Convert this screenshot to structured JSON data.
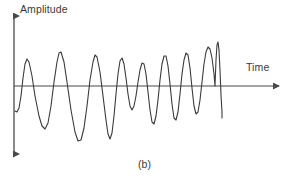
{
  "figure": {
    "caption": "(b)",
    "axes": {
      "y_label": "Amplitude",
      "x_label": "Time",
      "axis_color": "#4a4a4a",
      "y_axis_x": 14,
      "y_axis_top": 12,
      "y_axis_bottom": 158,
      "x_axis_y": 86,
      "x_axis_left": 14,
      "x_axis_right": 283
    },
    "curve": {
      "color": "#3a3a3a",
      "stroke_width": 1.1,
      "description": "amplitude-modulated oscillation with increasing frequency"
    }
  },
  "chart_data": {
    "type": "line",
    "title": "",
    "subtitle": "(b)",
    "xlabel": "Time",
    "ylabel": "Amplitude",
    "grid": false,
    "legend": false,
    "axis_origin": [
      14,
      86
    ],
    "xlim": [
      14,
      283
    ],
    "ylim": [
      158,
      12
    ],
    "series": [
      {
        "name": "signal",
        "color": "#3a3a3a",
        "points_px": [
          [
            15,
            111
          ],
          [
            17,
            112
          ],
          [
            19,
            108
          ],
          [
            21,
            96
          ],
          [
            23,
            78
          ],
          [
            25,
            64
          ],
          [
            27,
            59
          ],
          [
            29,
            62
          ],
          [
            32,
            76
          ],
          [
            35,
            96
          ],
          [
            39,
            116
          ],
          [
            42,
            126
          ],
          [
            45,
            129
          ],
          [
            48,
            123
          ],
          [
            51,
            106
          ],
          [
            54,
            82
          ],
          [
            57,
            62
          ],
          [
            59,
            53
          ],
          [
            61,
            52
          ],
          [
            64,
            62
          ],
          [
            67,
            82
          ],
          [
            71,
            110
          ],
          [
            75,
            132
          ],
          [
            78,
            141
          ],
          [
            81,
            140
          ],
          [
            84,
            128
          ],
          [
            87,
            106
          ],
          [
            90,
            80
          ],
          [
            93,
            62
          ],
          [
            95,
            55
          ],
          [
            97,
            57
          ],
          [
            100,
            72
          ],
          [
            103,
            96
          ],
          [
            106,
            120
          ],
          [
            108,
            134
          ],
          [
            110,
            139
          ],
          [
            112,
            133
          ],
          [
            114,
            116
          ],
          [
            116,
            94
          ],
          [
            118,
            74
          ],
          [
            120,
            61
          ],
          [
            122,
            58
          ],
          [
            124,
            64
          ],
          [
            126,
            78
          ],
          [
            128,
            94
          ],
          [
            130,
            106
          ],
          [
            132,
            110
          ],
          [
            134,
            106
          ],
          [
            136,
            96
          ],
          [
            138,
            82
          ],
          [
            140,
            70
          ],
          [
            142,
            63
          ],
          [
            144,
            64
          ],
          [
            146,
            74
          ],
          [
            148,
            92
          ],
          [
            150,
            110
          ],
          [
            152,
            122
          ],
          [
            154,
            124
          ],
          [
            156,
            116
          ],
          [
            158,
            100
          ],
          [
            160,
            80
          ],
          [
            162,
            64
          ],
          [
            164,
            56
          ],
          [
            166,
            56
          ],
          [
            168,
            66
          ],
          [
            170,
            84
          ],
          [
            172,
            104
          ],
          [
            174,
            118
          ],
          [
            176,
            120
          ],
          [
            178,
            112
          ],
          [
            180,
            94
          ],
          [
            182,
            74
          ],
          [
            184,
            60
          ],
          [
            186,
            53
          ],
          [
            188,
            55
          ],
          [
            190,
            68
          ],
          [
            192,
            88
          ],
          [
            194,
            106
          ],
          [
            196,
            114
          ],
          [
            198,
            112
          ],
          [
            200,
            100
          ],
          [
            202,
            82
          ],
          [
            204,
            64
          ],
          [
            206,
            52
          ],
          [
            208,
            47
          ],
          [
            210,
            49
          ],
          [
            212,
            58
          ],
          [
            214,
            74
          ],
          [
            215,
            86
          ],
          [
            216,
            60
          ],
          [
            217,
            45
          ],
          [
            218,
            42
          ],
          [
            219,
            50
          ],
          [
            220,
            70
          ],
          [
            221,
            95
          ],
          [
            222,
            112
          ],
          [
            222,
            118
          ]
        ]
      }
    ]
  }
}
